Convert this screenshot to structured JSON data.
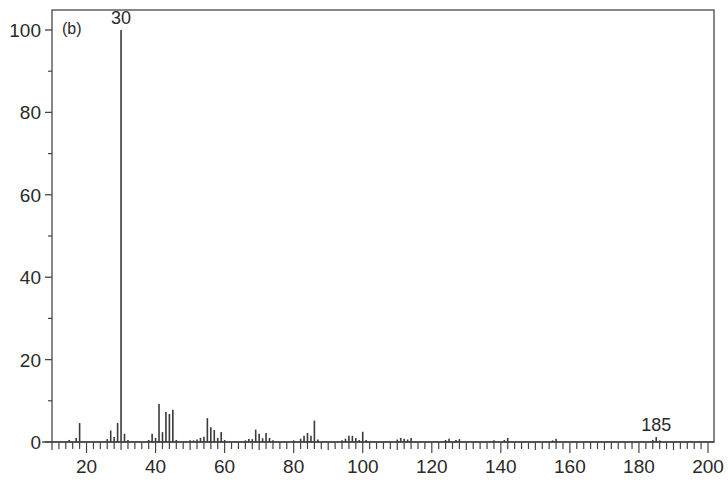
{
  "chart_data": {
    "type": "bar",
    "subtype": "mass-spectrum-stick",
    "panel_label": "(b)",
    "title": "",
    "xlabel": "",
    "ylabel": "",
    "xlim": [
      10,
      200
    ],
    "ylim": [
      0,
      100
    ],
    "grid": false,
    "legend": null,
    "x_ticks_major": [
      20,
      40,
      60,
      80,
      100,
      120,
      140,
      160,
      180,
      200
    ],
    "x_ticks_minor_step": 2,
    "y_ticks_major": [
      0,
      20,
      40,
      60,
      80,
      100
    ],
    "y_ticks_minor": [
      10,
      30,
      50,
      70,
      90
    ],
    "annotations": [
      {
        "x": 30,
        "label": "30"
      },
      {
        "x": 185,
        "label": "185"
      }
    ],
    "x": [
      15,
      17,
      18,
      26,
      27,
      28,
      29,
      30,
      31,
      32,
      38,
      39,
      40,
      41,
      42,
      43,
      44,
      45,
      46,
      50,
      51,
      52,
      53,
      54,
      55,
      56,
      57,
      58,
      59,
      60,
      66,
      67,
      68,
      69,
      70,
      71,
      72,
      73,
      74,
      80,
      82,
      83,
      84,
      85,
      86,
      87,
      94,
      95,
      96,
      97,
      98,
      99,
      100,
      101,
      110,
      111,
      112,
      113,
      114,
      124,
      125,
      127,
      128,
      138,
      141,
      142,
      155,
      156,
      184,
      185,
      186
    ],
    "values": [
      0.5,
      1.0,
      4.6,
      0.7,
      2.8,
      1.2,
      4.6,
      100,
      2.0,
      0.5,
      0.5,
      2.0,
      1.0,
      9.2,
      2.4,
      7.3,
      6.8,
      7.8,
      0.5,
      0.4,
      0.4,
      0.6,
      1.0,
      1.3,
      5.8,
      3.6,
      2.9,
      1.0,
      2.4,
      0.5,
      0.4,
      0.7,
      0.7,
      3.0,
      2.0,
      0.9,
      2.2,
      1.0,
      0.4,
      0.4,
      0.8,
      1.5,
      2.2,
      1.5,
      5.2,
      0.6,
      0.4,
      0.8,
      1.5,
      1.5,
      1.0,
      0.5,
      2.5,
      0.5,
      0.6,
      1.0,
      0.8,
      0.6,
      1.0,
      0.5,
      0.8,
      0.5,
      0.7,
      0.4,
      0.5,
      1.0,
      0.4,
      0.8,
      0.5,
      1.2,
      0.4
    ]
  }
}
